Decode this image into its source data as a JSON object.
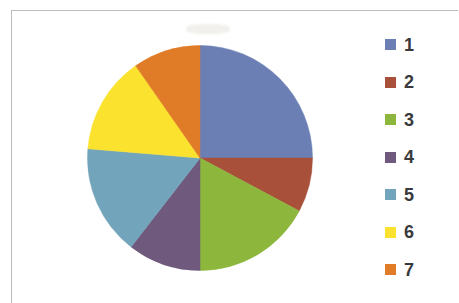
{
  "chart_data": {
    "type": "pie",
    "title": "",
    "subtitle": "",
    "xlabel": "",
    "ylabel": "",
    "legend_position": "right",
    "grid": false,
    "categories": [
      "1",
      "2",
      "3",
      "4",
      "5",
      "6",
      "7"
    ],
    "values": [
      25.0,
      7.8,
      17.2,
      10.5,
      15.8,
      14.0,
      9.7
    ],
    "units": "percent",
    "start_angle_deg": 90,
    "direction": "clockwise",
    "slice_angles_deg": [
      90,
      28,
      62,
      38,
      57,
      50,
      35
    ],
    "colors": [
      "#6b7fb5",
      "#a8503a",
      "#8cb63c",
      "#6f5a7e",
      "#72a5bb",
      "#fbe22e",
      "#e07b28"
    ],
    "series": [
      {
        "name": "Series 1",
        "values": [
          25.0,
          7.8,
          17.2,
          10.5,
          15.8,
          14.0,
          9.7
        ]
      }
    ],
    "data_labels_shown": false,
    "annotations": []
  },
  "legend": {
    "title": "",
    "items": [
      {
        "label": "1",
        "color": "#6b7fb5"
      },
      {
        "label": "2",
        "color": "#a8503a"
      },
      {
        "label": "3",
        "color": "#8cb63c"
      },
      {
        "label": "4",
        "color": "#6f5a7e"
      },
      {
        "label": "5",
        "color": "#72a5bb"
      },
      {
        "label": "6",
        "color": "#fbe22e"
      },
      {
        "label": "7",
        "color": "#e07b28"
      }
    ]
  },
  "frame": {
    "border_color": "#b9bcc0",
    "background": "#ffffff"
  }
}
